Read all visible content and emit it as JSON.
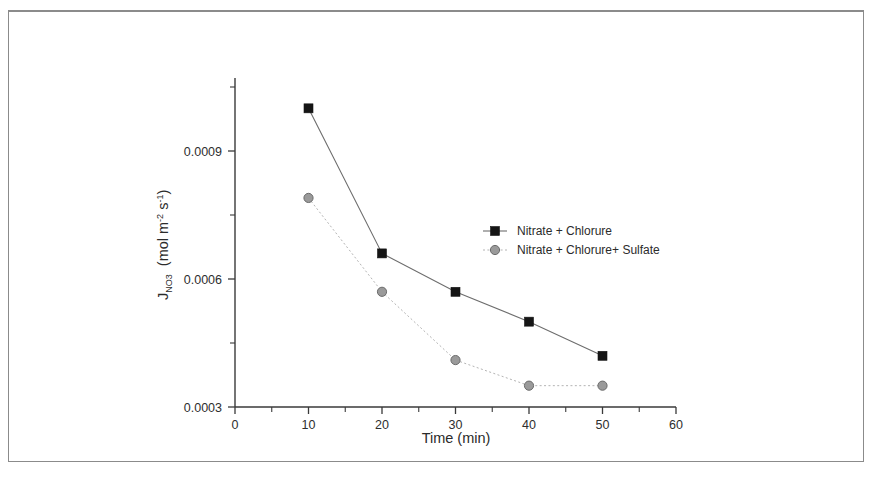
{
  "chart_data": {
    "type": "line",
    "title": "",
    "subtitle": "",
    "xlabel": "Time (min)",
    "ylabel": "J",
    "ylabel_sub": "NO3",
    "ylabel_units": "(mol m-2 s-1)",
    "ylabel_full": "J_NO3 (mol m-2 s-1)",
    "x": [
      10,
      20,
      30,
      40,
      50
    ],
    "xlim": [
      0,
      60
    ],
    "ylim": [
      0.0003,
      0.00105
    ],
    "xticks": [
      0,
      10,
      20,
      30,
      40,
      50,
      60
    ],
    "xticklabels": [
      "0",
      "10",
      "20",
      "30",
      "40",
      "50",
      "60"
    ],
    "xminorticks": [
      5,
      15,
      25,
      35,
      45,
      55
    ],
    "yticks": [
      0.0003,
      0.0006,
      0.0009
    ],
    "yticklabels": [
      "0.0003",
      "0.0006",
      "0.0009"
    ],
    "yminorticks": [
      0.00045,
      0.00075,
      0.00105
    ],
    "grid": false,
    "legend_position": "center-right",
    "series": [
      {
        "name": "Nitrate + Chlorure",
        "marker": "square",
        "color": "#151515",
        "linestyle": "solid",
        "values": [
          0.001,
          0.00066,
          0.00057,
          0.0005,
          0.00042
        ]
      },
      {
        "name": "Nitrate + Chlorure+ Sulfate",
        "marker": "circle",
        "color": "#9a9a9a",
        "linestyle": "dotted",
        "values": [
          0.00079,
          0.00057,
          0.00041,
          0.00035,
          0.00035
        ]
      }
    ]
  },
  "figure": {
    "background_color": "#ffffff",
    "frame_color": "#8b8b8b",
    "axis_color": "#3a3a3a"
  }
}
